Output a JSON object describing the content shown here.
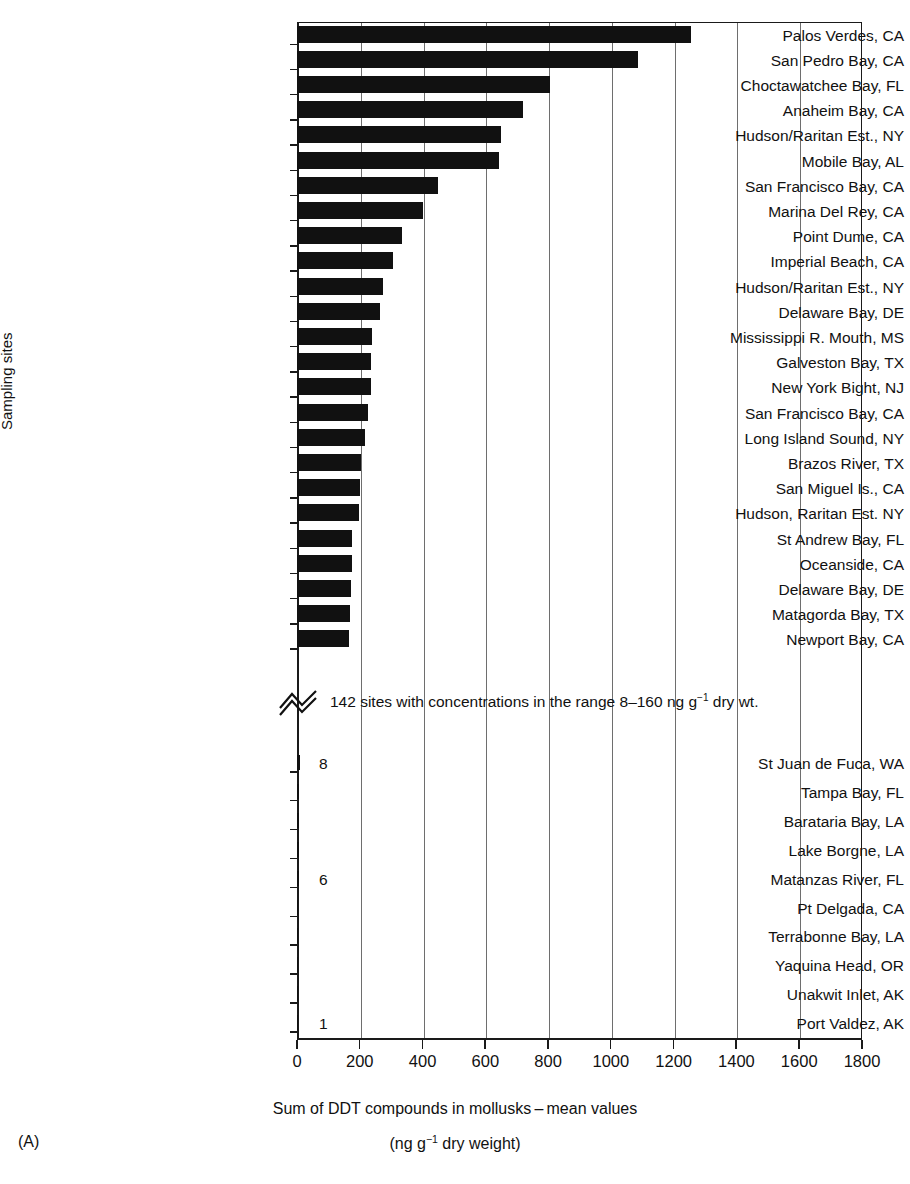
{
  "panel": {
    "id": "(A)"
  },
  "axes": {
    "ylabel": "Sampling sites",
    "xtitle_line1": "Sum of DDT compounds in mollusks – mean values",
    "xtitle_line2_pre": "(ng g",
    "xtitle_line2_sup": "−1",
    "xtitle_line2_post": " dry weight)",
    "xticks": [
      0,
      200,
      400,
      600,
      800,
      1000,
      1200,
      1400,
      1600,
      1800
    ],
    "xlim": [
      0,
      1800
    ]
  },
  "break_note": {
    "text_pre": "142 sites with concentrations in the range 8–160 ng g",
    "text_sup": "−1",
    "text_post": " dry wt."
  },
  "chart_data": {
    "type": "bar",
    "orientation": "horizontal",
    "xlabel": "Sum of DDT compounds in mollusks – mean values (ng g−1 dry weight)",
    "ylabel": "Sampling sites",
    "xlim": [
      0,
      1800
    ],
    "xticks": [
      0,
      200,
      400,
      600,
      800,
      1000,
      1200,
      1400,
      1600,
      1800
    ],
    "grid": "vertical",
    "legend": "none",
    "axis_break": {
      "after_category": "Newport Bay, CA",
      "annotation": "142 sites with concentrations in the range 8–160 ng g−1 dry wt."
    },
    "categories": [
      "Palos Verdes, CA",
      "San Pedro Bay, CA",
      "Choctawatchee Bay, FL",
      "Anaheim Bay, CA",
      "Hudson/Raritan Est., NY",
      "Mobile Bay, AL",
      "San Francisco Bay, CA",
      "Marina Del Rey, CA",
      "Point Dume, CA",
      "Imperial Beach, CA",
      "Hudson/Raritan Est., NY",
      "Delaware Bay, DE",
      "Mississippi R. Mouth, MS",
      "Galveston Bay, TX",
      "New York Bight, NJ",
      "San Francisco Bay, CA",
      "Long Island Sound, NY",
      "Brazos River, TX",
      "San Miguel Is., CA",
      "Hudson, Raritan Est. NY",
      "St Andrew Bay, FL",
      "Oceanside, CA",
      "Delaware Bay, DE",
      "Matagorda Bay, TX",
      "Newport Bay, CA",
      "St Juan de Fuca, WA",
      "Tampa Bay, FL",
      "Barataria Bay, LA",
      "Lake Borgne, LA",
      "Matanzas River, FL",
      "Pt Delgada, CA",
      "Terrabonne Bay, LA",
      "Yaquina Head, OR",
      "Unakwit Inlet, AK",
      "Port Valdez, AK"
    ],
    "values": [
      1255,
      1085,
      805,
      720,
      650,
      645,
      450,
      400,
      335,
      305,
      275,
      265,
      240,
      235,
      235,
      225,
      218,
      205,
      200,
      198,
      175,
      175,
      172,
      170,
      165,
      8,
      7.5,
      7,
      6.5,
      6,
      4,
      3,
      2.5,
      1.5,
      1
    ],
    "value_labels": [
      {
        "category": "St Juan de Fuca, WA",
        "label": "8"
      },
      {
        "category": "Matanzas River, FL",
        "label": "6"
      },
      {
        "category": "Port Valdez, AK",
        "label": "1"
      }
    ]
  }
}
